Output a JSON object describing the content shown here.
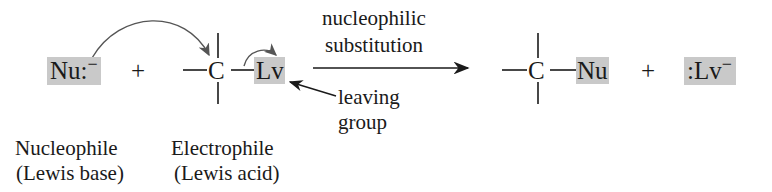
{
  "diagram": {
    "reactants": {
      "nucleophile": {
        "symbol": "Nu",
        "lone_pair": ":",
        "charge": "−"
      },
      "plus": "+",
      "electrophile": {
        "carbon": "C",
        "leaving_group": "Lv"
      }
    },
    "arrow": {
      "line1": "nucleophilic",
      "line2": "substitution"
    },
    "leaving_group_label": {
      "line1": "leaving",
      "line2": "group"
    },
    "products": {
      "carbon": "C",
      "nucleophile": "Nu",
      "plus": "+",
      "leaving_group": {
        "lone_pair": ":",
        "symbol": "Lv",
        "charge": "−"
      }
    },
    "captions": {
      "nucleophile": {
        "line1": "Nucleophile",
        "line2": "(Lewis base)"
      },
      "electrophile": {
        "line1": "Electrophile",
        "line2": "(Lewis acid)"
      }
    },
    "colors": {
      "highlight_box": "#c9c9c9",
      "ink": "#1a1a1a",
      "curved_arrow": "#555555"
    }
  }
}
